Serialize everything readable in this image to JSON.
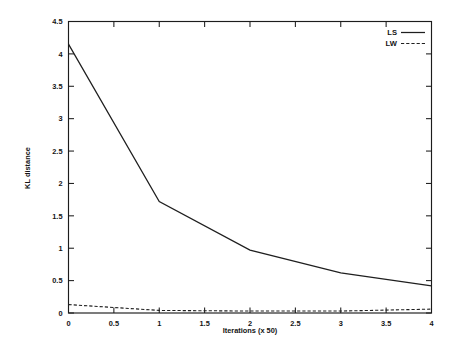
{
  "chart_data": {
    "type": "line",
    "title": "",
    "xlabel": "Iterations (x 50)",
    "ylabel": "KL distance",
    "xlim": [
      0,
      4
    ],
    "ylim": [
      0,
      4.5
    ],
    "grid": false,
    "legend_position": "top-right",
    "xticks": [
      0,
      0.5,
      1,
      1.5,
      2,
      2.5,
      3,
      3.5,
      4
    ],
    "xtick_labels": [
      "0",
      "0.5",
      "1",
      "1.5",
      "2",
      "2.5",
      "3",
      "3.5",
      "4"
    ],
    "yticks": [
      0,
      0.5,
      1,
      1.5,
      2,
      2.5,
      3,
      3.5,
      4,
      4.5
    ],
    "ytick_labels": [
      "0",
      "0.5",
      "1",
      "1.5",
      "2",
      "2.5",
      "3",
      "3.5",
      "4",
      "4.5"
    ],
    "x": [
      0,
      1,
      2,
      3,
      4
    ],
    "series": [
      {
        "name": "LS",
        "style": "solid",
        "values": [
          4.15,
          1.72,
          0.97,
          0.62,
          0.42
        ]
      },
      {
        "name": "LW",
        "style": "dashed",
        "values": [
          0.13,
          0.04,
          0.03,
          0.03,
          0.06
        ]
      }
    ]
  },
  "legend": {
    "entries": [
      {
        "label": "LS",
        "style": "solid"
      },
      {
        "label": "LW",
        "style": "dashed"
      }
    ]
  }
}
